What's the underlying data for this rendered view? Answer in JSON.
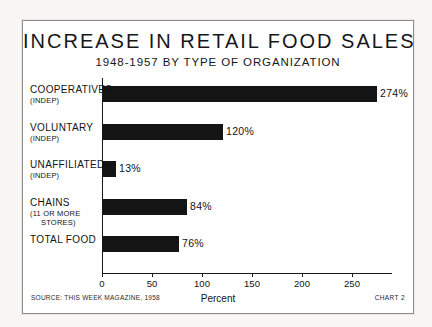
{
  "chart_data": {
    "type": "bar",
    "orientation": "horizontal",
    "title": "INCREASE IN RETAIL FOOD SALES",
    "subtitle": "1948-1957 BY TYPE OF ORGANIZATION",
    "xlabel": "Percent",
    "ylabel": "",
    "xlim": [
      0,
      290
    ],
    "xticks": [
      0,
      50,
      100,
      150,
      200,
      250
    ],
    "xtick_labels": [
      "0",
      "50",
      "100",
      "150",
      "200",
      "250"
    ],
    "grid": false,
    "legend": false,
    "bar_color": "#141414",
    "categories": [
      "COOPERATIVES (INDEP)",
      "VOLUNTARY (INDEP)",
      "UNAFFILIATED (INDEP)",
      "CHAINS (11 OR MORE STORES)",
      "TOTAL FOOD"
    ],
    "values": [
      274,
      120,
      13,
      84,
      76
    ],
    "value_labels": [
      "274%",
      "120%",
      "13%",
      "84%",
      "76%"
    ],
    "bars": [
      {
        "label_main": "COOPERATIVES",
        "label_sub": "(INDEP)",
        "label_sub2": "",
        "value": 274,
        "value_label": "274%"
      },
      {
        "label_main": "VOLUNTARY",
        "label_sub": "(INDEP)",
        "label_sub2": "",
        "value": 120,
        "value_label": "120%"
      },
      {
        "label_main": "UNAFFILIATED",
        "label_sub": "(INDEP)",
        "label_sub2": "",
        "value": 13,
        "value_label": "13%"
      },
      {
        "label_main": "CHAINS",
        "label_sub": "(11 OR MORE",
        "label_sub2": "STORES)",
        "value": 84,
        "value_label": "84%"
      },
      {
        "label_main": "TOTAL FOOD",
        "label_sub": "",
        "label_sub2": "",
        "value": 76,
        "value_label": "76%"
      }
    ]
  },
  "footer": {
    "source": "SOURCE: THIS WEEK MAGAZINE, 1958",
    "chart_number": "CHART 2"
  }
}
